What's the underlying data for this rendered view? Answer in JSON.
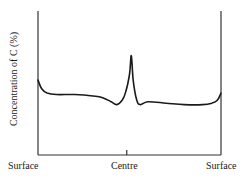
{
  "chart_data": {
    "type": "line",
    "title": "",
    "xlabel": "",
    "ylabel": "Concentration of C (%)",
    "x_tick_labels": [
      "Surface",
      "Centre",
      "Surface"
    ],
    "x": [
      0.0,
      0.02,
      0.05,
      0.1,
      0.2,
      0.3,
      0.35,
      0.4,
      0.43,
      0.46,
      0.48,
      0.5,
      0.51,
      0.52,
      0.54,
      0.56,
      0.6,
      0.7,
      0.8,
      0.9,
      0.95,
      0.98,
      1.0
    ],
    "series": [
      {
        "name": "Carbon concentration profile",
        "values": [
          0.52,
          0.46,
          0.43,
          0.42,
          0.42,
          0.41,
          0.4,
          0.37,
          0.35,
          0.38,
          0.44,
          0.56,
          0.69,
          0.52,
          0.38,
          0.35,
          0.37,
          0.36,
          0.35,
          0.35,
          0.36,
          0.38,
          0.43
        ]
      }
    ],
    "ylim": [
      0,
      1
    ],
    "xlim": [
      0,
      1
    ],
    "grid": false,
    "legend": "none",
    "frame": "left, right and bottom axes only; single centre tick"
  },
  "labels": {
    "ylabel": "Concentration of C (%)",
    "x_left": "Surface",
    "x_center": "Centre",
    "x_right": "Surface"
  },
  "style": {
    "line_color": "#1a1a1a",
    "axis_color": "#333333",
    "background": "#ffffff"
  }
}
